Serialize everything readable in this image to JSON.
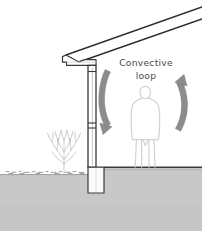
{
  "diagram": {
    "type": "architectural-section",
    "canvas": {
      "width": 202,
      "height": 231,
      "background": "#ffffff"
    },
    "annotation": {
      "name": "convective-loop-label",
      "line1": "Convective",
      "line2": "loop",
      "color": "#4a4a4a",
      "x": 146,
      "y1": 66,
      "y2": 79
    },
    "palette": {
      "outline": "#3a3a3a",
      "roof_line": "#2e2e2e",
      "wall_fill": "#ffffff",
      "wall_inner_line": "#b8b8b8",
      "ground_fill": "#c8c8c8",
      "ground_edge": "#9a9a9a",
      "grade_texture": "#8e8e8e",
      "arrow_fill": "#8c8c8c",
      "arrow_stroke": "#7a7a7a",
      "person_outline": "#d2d2d2",
      "shrub_stroke": "#b0b0b0",
      "floor_line": "#3a3a3a"
    },
    "elements": [
      {
        "name": "roof-slope-upper",
        "label": "Upper roof line",
        "kind": "line"
      },
      {
        "name": "roof-slope-lower",
        "label": "Lower roof / ceiling line",
        "kind": "line"
      },
      {
        "name": "eave-soffit",
        "label": "Eave and soffit",
        "kind": "profile"
      },
      {
        "name": "exterior-wall",
        "label": "Exterior wall section",
        "kind": "wall"
      },
      {
        "name": "foundation-wall",
        "label": "Foundation wall below grade",
        "kind": "wall"
      },
      {
        "name": "floor-slab-line",
        "label": "Interior floor line",
        "kind": "line"
      },
      {
        "name": "ground-mass",
        "label": "Ground / soil mass",
        "kind": "fill"
      },
      {
        "name": "grade-line",
        "label": "Exterior grade line",
        "kind": "line"
      },
      {
        "name": "shrub",
        "label": "Shrub at exterior",
        "kind": "plant"
      },
      {
        "name": "occupant-figure",
        "label": "Standing occupant",
        "kind": "figure"
      },
      {
        "name": "downdraft-arrow",
        "label": "Downward airflow arrow at wall",
        "kind": "arrow",
        "direction": "down"
      },
      {
        "name": "updraft-arrow",
        "label": "Upward airflow arrow in room",
        "kind": "arrow",
        "direction": "up"
      }
    ]
  }
}
